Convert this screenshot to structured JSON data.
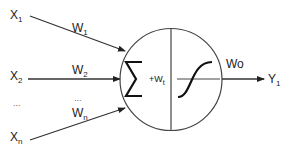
{
  "diagram": {
    "inputs": [
      {
        "label": "X",
        "sub": "1",
        "weight": "W",
        "weight_sub": "1"
      },
      {
        "label": "X",
        "sub": "2",
        "weight": "W",
        "weight_sub": "2"
      },
      {
        "label": "...",
        "sub": "",
        "weight": "...",
        "weight_sub": ""
      },
      {
        "label": "X",
        "sub": "n",
        "weight": "W",
        "weight_sub": "n"
      }
    ],
    "summation_symbol": "∑",
    "bias_label": "+W",
    "bias_sub": "t",
    "activation": "sigmoid",
    "output_weight": "Wo",
    "output": {
      "label": "Y",
      "sub": "1"
    },
    "colors": {
      "stroke": "#333333",
      "background": "#ffffff"
    }
  }
}
